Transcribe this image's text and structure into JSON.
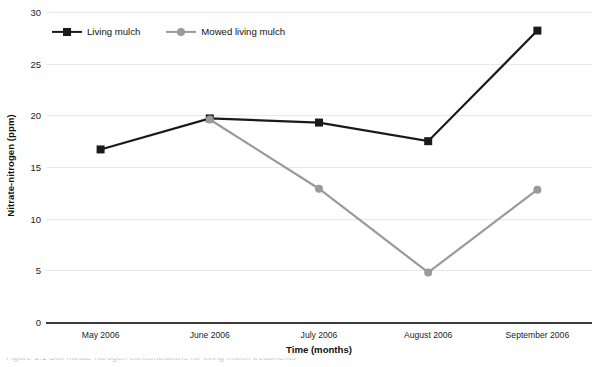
{
  "chart_data": {
    "type": "line",
    "title": "",
    "xlabel": "Time (months)",
    "ylabel": "Nitrate-nitrogen (ppm)",
    "categories": [
      "May 2006",
      "June 2006",
      "July 2006",
      "August 2006",
      "September 2006"
    ],
    "ylim": [
      0,
      30
    ],
    "yticks": [
      0,
      5,
      10,
      15,
      20,
      25,
      30
    ],
    "ytick_labels": [
      "0",
      "5",
      "10",
      "15",
      "20",
      "25",
      "30"
    ],
    "grid": true,
    "legend_position": "top-left",
    "series": [
      {
        "name": "Living mulch",
        "color": "#1a1a1a",
        "marker": "square",
        "values": [
          16.7,
          19.7,
          19.3,
          17.5,
          28.2
        ]
      },
      {
        "name": "Mowed living mulch",
        "color": "#9a9a9a",
        "marker": "circle",
        "values": [
          null,
          19.6,
          12.9,
          4.8,
          12.8
        ]
      }
    ]
  },
  "axis": {
    "y_title": "Nitrate-nitrogen (ppm)",
    "x_title": "Time (months)"
  },
  "legend": {
    "items": [
      {
        "label": "Living mulch",
        "color": "#1a1a1a",
        "marker": "square"
      },
      {
        "label": "Mowed living mulch",
        "color": "#9a9a9a",
        "marker": "circle"
      }
    ]
  },
  "caption": {
    "text": "Figure 1.1 Soil nitrate-nitrogen concentrations for living mulch treatments"
  }
}
